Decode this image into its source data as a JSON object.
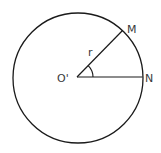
{
  "diagram": {
    "type": "geometry-circle",
    "circle": {
      "cx": 78,
      "cy": 78,
      "r": 65,
      "stroke": "#1a1a1a"
    },
    "center": {
      "label": "O'",
      "x": 77,
      "y": 77
    },
    "points": [
      {
        "label": "M",
        "x": 122.5,
        "y": 30.5
      },
      {
        "label": "N",
        "x": 142.5,
        "y": 77
      }
    ],
    "segments": [
      {
        "from": "O'",
        "to": "M",
        "label": "r"
      },
      {
        "from": "O'",
        "to": "N",
        "label": ""
      }
    ],
    "angle": {
      "vertex": "O'",
      "between": [
        "N",
        "M"
      ],
      "arc_radius": 16
    },
    "labels": {
      "center": "O'",
      "m": "M",
      "n": "N",
      "radius": "r"
    }
  }
}
